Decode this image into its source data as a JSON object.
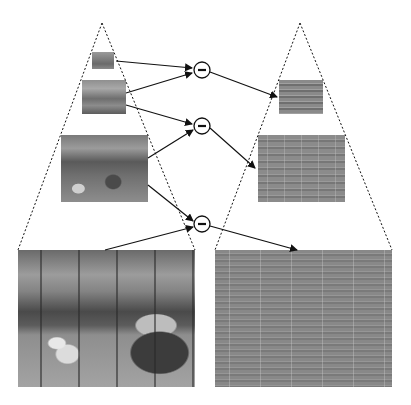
{
  "diagram": {
    "title": "",
    "type": "laplacian-pyramid",
    "left_pyramid": {
      "name": "gaussian-pyramid",
      "levels": [
        {
          "level": 3,
          "description": "smallest blurred street scene"
        },
        {
          "level": 2,
          "description": "small blurred street scene"
        },
        {
          "level": 1,
          "description": "medium blurred street scene"
        },
        {
          "level": 0,
          "description": "full-resolution street scene with trams and vans"
        }
      ]
    },
    "right_pyramid": {
      "name": "laplacian-pyramid",
      "levels": [
        {
          "level": 2,
          "description": "small band-pass edge image"
        },
        {
          "level": 1,
          "description": "medium band-pass edge image"
        },
        {
          "level": 0,
          "description": "full-resolution band-pass edge image"
        }
      ]
    },
    "operators": [
      {
        "symbol": "−",
        "inputs": [
          "level 3",
          "level 2"
        ],
        "output": "laplacian level 2"
      },
      {
        "symbol": "−",
        "inputs": [
          "level 2",
          "level 1"
        ],
        "output": "laplacian level 1"
      },
      {
        "symbol": "−",
        "inputs": [
          "level 1",
          "level 0"
        ],
        "output": "laplacian level 0"
      }
    ],
    "colors": {
      "line": "#111111",
      "background": "#ffffff",
      "laplacian_gray": "#8a8a8a"
    }
  }
}
